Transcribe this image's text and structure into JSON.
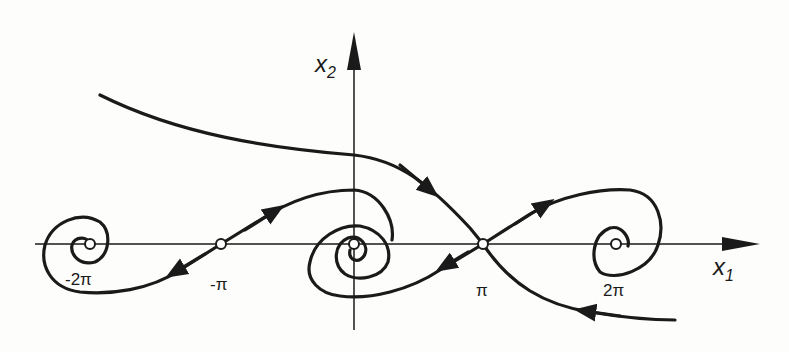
{
  "diagram": {
    "type": "phase-portrait",
    "axes": {
      "x": {
        "name": "x",
        "subscript": "1"
      },
      "y": {
        "name": "x",
        "subscript": "2"
      }
    },
    "ticks": [
      {
        "id": "neg-2pi",
        "label": "-2π"
      },
      {
        "id": "neg-pi",
        "label": "-π"
      },
      {
        "id": "pi",
        "label": "π"
      },
      {
        "id": "2pi",
        "label": "2π"
      }
    ],
    "equilibria": [
      {
        "x": "-2π",
        "kind": "stable focus"
      },
      {
        "x": "-π",
        "kind": "saddle"
      },
      {
        "x": "0",
        "kind": "stable focus"
      },
      {
        "x": "π",
        "kind": "saddle"
      },
      {
        "x": "2π",
        "kind": "stable focus"
      }
    ],
    "colors": {
      "ink": "#1a1a1a",
      "background": "#fdfdfc"
    }
  }
}
